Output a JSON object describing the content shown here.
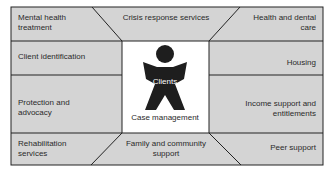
{
  "diagram": {
    "center": {
      "figure_label": "Clients",
      "caption": "Case management"
    },
    "cells": {
      "top_left": "Mental health treatment",
      "top_center": "Crisis response services",
      "top_right": "Health and dental care",
      "left_upper": "Client identification",
      "right_upper": "Housing",
      "left_lower": "Protection and advocacy",
      "right_lower": "Income support and entitlements",
      "bottom_left": "Rehabilitation services",
      "bottom_center": "Family and community support",
      "bottom_right": "Peer support"
    },
    "colors": {
      "cell_fill": "#d4d4d4",
      "border": "#222222",
      "center_fill": "#ffffff",
      "figure": "#1e1e1e"
    }
  }
}
